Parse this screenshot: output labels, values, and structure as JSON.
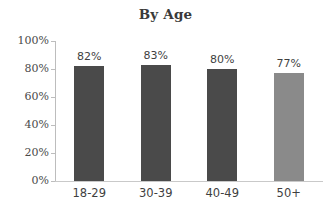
{
  "chart_data": {
    "type": "bar",
    "title": "By Age",
    "xlabel": "",
    "ylabel": "",
    "categories": [
      "18-29",
      "30-39",
      "40-49",
      "50+"
    ],
    "values": [
      82,
      83,
      80,
      77
    ],
    "value_labels": [
      "82%",
      "83%",
      "80%",
      "77%"
    ],
    "bar_colors": [
      "#4a4a4a",
      "#4a4a4a",
      "#4a4a4a",
      "#8a8a8a"
    ],
    "ylim": [
      0,
      100
    ],
    "ytick_values": [
      0,
      20,
      40,
      60,
      80,
      100
    ],
    "ytick_labels": [
      "0%",
      "20%",
      "40%",
      "60%",
      "80%",
      "100%"
    ],
    "grid": false,
    "legend": "none",
    "axis_color": "#bdbdbd",
    "background": "#ffffff"
  }
}
